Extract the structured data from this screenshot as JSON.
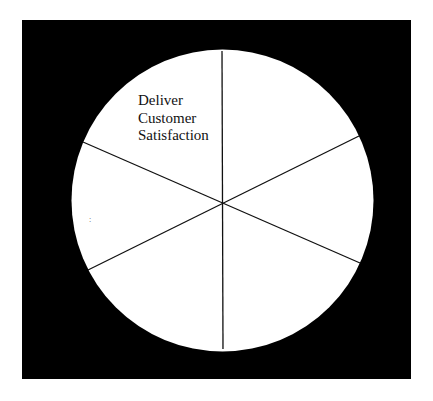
{
  "diagram": {
    "type": "segmented-wheel",
    "segments": 6,
    "background_color": "#000000",
    "wheel_color": "#ffffff",
    "line_color": "#111111",
    "segment_labels": [
      {
        "segment": "top-left",
        "lines": [
          "Deliver",
          "Customer",
          "Satisfaction"
        ]
      },
      {
        "segment": "top-right",
        "lines": []
      },
      {
        "segment": "right",
        "lines": []
      },
      {
        "segment": "bottom-right",
        "lines": []
      },
      {
        "segment": "bottom-left",
        "lines": []
      },
      {
        "segment": "left",
        "lines": []
      }
    ],
    "stray_mark": ":"
  }
}
